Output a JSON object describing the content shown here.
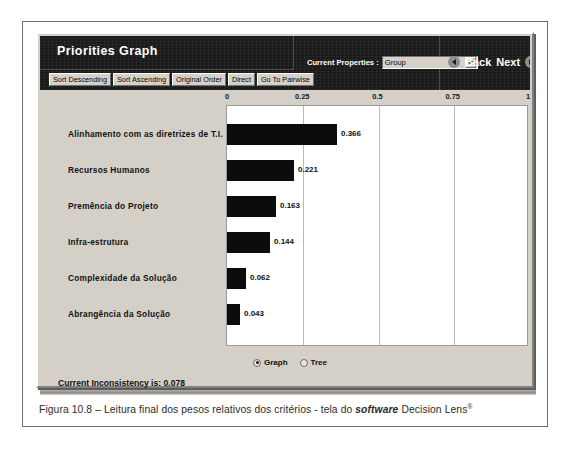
{
  "window": {
    "title": "Priorities Graph"
  },
  "toolbar": {
    "buttons": [
      {
        "label": "Sort Descending",
        "name": "sort-descending-button"
      },
      {
        "label": "Sort Ascending",
        "name": "sort-ascending-button"
      },
      {
        "label": "Original Order",
        "name": "original-order-button"
      },
      {
        "label": "Direct",
        "name": "direct-button"
      },
      {
        "label": "Go To Pairwise",
        "name": "go-to-pairwise-button"
      }
    ]
  },
  "properties": {
    "label": "Current Properties :",
    "selected": "Group",
    "options": [
      "Group"
    ],
    "caret_icon": "chevron-down-icon"
  },
  "navigation": {
    "back_label": "Back",
    "next_label": "Next",
    "back_icon": "arrow-left-circle-icon",
    "next_icon": "arrow-right-circle-icon"
  },
  "view_modes": {
    "options": [
      {
        "label": "Graph",
        "selected": true
      },
      {
        "label": "Tree",
        "selected": false
      }
    ]
  },
  "status": {
    "text": "Current Inconsistency is: 0.078",
    "inconsistency": 0.078
  },
  "caption": {
    "prefix": "Figura 10.8 – Leitura final dos pesos relativos dos critérios - tela do ",
    "italic": "software",
    "suffix": " Decision Lens",
    "registered": "®"
  },
  "colors": {
    "header_band": "#1a1a1a",
    "window_face": "#d4d0c8",
    "bar_fill": "#0c0c0c",
    "plot_background": "#ffffff",
    "grid_line": "#b9b9b9"
  },
  "chart_data": {
    "type": "bar",
    "orientation": "horizontal",
    "title": "Priorities Graph",
    "xlabel": "",
    "ylabel": "",
    "xlim": [
      0,
      1
    ],
    "ticks": [
      "0",
      "0.25",
      "0.5",
      "0.75",
      "1"
    ],
    "tick_values": [
      0,
      0.25,
      0.5,
      0.75,
      1
    ],
    "grid": true,
    "legend": "none",
    "categories": [
      "Alinhamento com as diretrizes de T.I.",
      "Recursos Humanos",
      "Premência do Projeto",
      "Infra-estrutura",
      "Complexidade da Solução",
      "Abrangência da Solução"
    ],
    "values": [
      0.366,
      0.221,
      0.163,
      0.144,
      0.062,
      0.043
    ],
    "data_labels": [
      "0.366",
      "0.221",
      "0.163",
      "0.144",
      "0.062",
      "0.043"
    ]
  }
}
